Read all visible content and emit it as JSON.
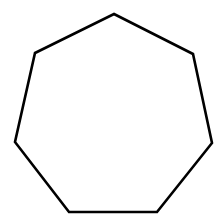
{
  "figure": {
    "shape": "heptagon",
    "sides": 7,
    "width": 224,
    "height": 224,
    "background": "#ffffff",
    "stroke_color": "#000000",
    "stroke_width": 2.6,
    "fill": "none",
    "vertices": [
      [
        114,
        14
      ],
      [
        193,
        54
      ],
      [
        212,
        143
      ],
      [
        157,
        212
      ],
      [
        69,
        212
      ],
      [
        15,
        142
      ],
      [
        35,
        53
      ]
    ]
  }
}
